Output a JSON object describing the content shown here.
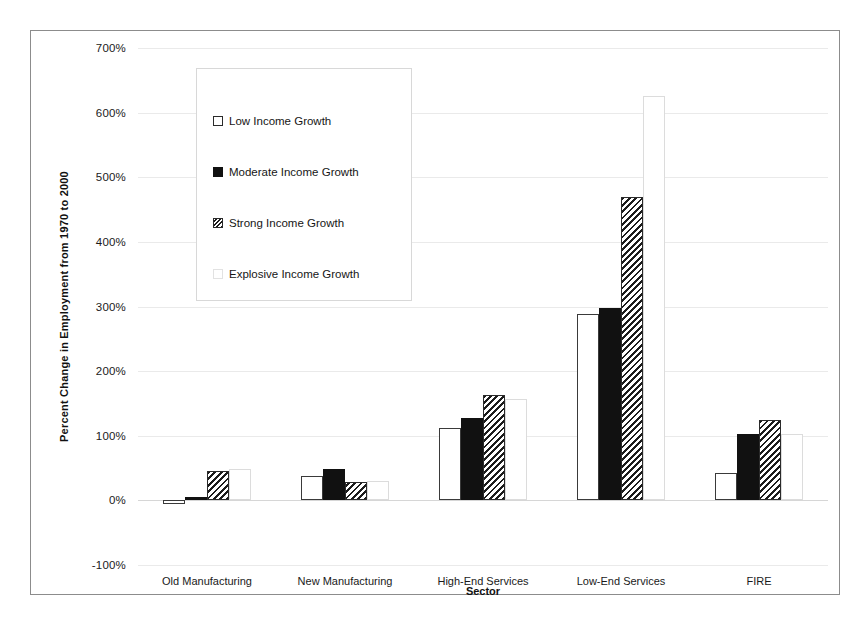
{
  "chart_data": {
    "type": "bar",
    "title": "",
    "xlabel": "Sector",
    "ylabel": "Percent Change in Employment from 1970 to 2000",
    "categories": [
      "Old Manufacturing",
      "New Manufacturing",
      "High-End Services",
      "Low-End Services",
      "FIRE"
    ],
    "series": [
      {
        "name": "Low Income Growth",
        "style": "white-outline",
        "values": [
          -5,
          38,
          112,
          288,
          43
        ]
      },
      {
        "name": "Moderate Income Growth",
        "style": "solid-black",
        "values": [
          5,
          48,
          128,
          297,
          103
        ]
      },
      {
        "name": "Strong Income Growth",
        "style": "diagonal-hatch",
        "values": [
          45,
          28,
          163,
          470,
          125
        ]
      },
      {
        "name": "Explosive Income Growth",
        "style": "very-light",
        "values": [
          48,
          30,
          157,
          625,
          103
        ]
      }
    ],
    "ylim": [
      -100,
      700
    ],
    "ytick_step": 100,
    "ytick_labels": [
      "700%",
      "600%",
      "500%",
      "400%",
      "300%",
      "200%",
      "100%",
      "0%",
      "-100%"
    ],
    "ytick_values": [
      700,
      600,
      500,
      400,
      300,
      200,
      100,
      0,
      -100
    ],
    "grid": true,
    "legend_position": "inside-upper-left",
    "value_suffix": "%"
  },
  "legend": {
    "items": [
      {
        "label": "Low Income Growth",
        "swatch": "white-outline"
      },
      {
        "label": "Moderate Income Growth",
        "swatch": "solid-black"
      },
      {
        "label": "Strong Income Growth",
        "swatch": "diagonal-hatch"
      },
      {
        "label": "Explosive Income Growth",
        "swatch": "very-light"
      }
    ]
  },
  "colors": {
    "bar_outline": "#3a3a3a",
    "bar_solid": "#111111",
    "hatch": "#1c1c1c",
    "gridline": "#eaeaea",
    "frame": "#8c8c8c",
    "background": "#ffffff",
    "text": "#1a1a1a"
  }
}
